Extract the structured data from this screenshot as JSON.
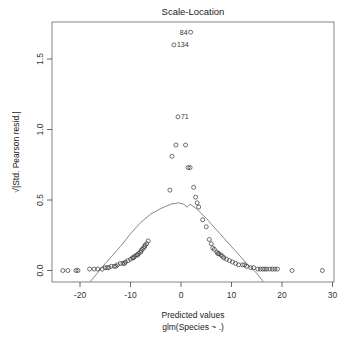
{
  "chart_data": {
    "type": "scatter",
    "title": "Scale-Location",
    "xlabel": "Predicted values",
    "xlabel_sub": "glm(Species ~ .)",
    "ylabel": "√|Std. Pearson resid.|",
    "xlim": [
      -25.5,
      30.3
    ],
    "ylim": [
      -0.08,
      1.76
    ],
    "x_ticks": [
      -20,
      -10,
      0,
      10,
      20,
      30
    ],
    "y_ticks": [
      0.0,
      0.5,
      1.0,
      1.5
    ],
    "y_tick_labels": [
      "0.0",
      "0.5",
      "1.0",
      "1.5"
    ],
    "x_tick_labels": [
      "-20",
      "-10",
      "0",
      "10",
      "20",
      "30"
    ],
    "grid": false,
    "labeled_points": [
      {
        "id": "84",
        "x": 1.9,
        "y": 1.69,
        "label_side": "left"
      },
      {
        "id": "134",
        "x": -1.4,
        "y": 1.6,
        "label_side": "right"
      },
      {
        "id": "71",
        "x": -0.6,
        "y": 1.09,
        "label_side": "right"
      }
    ],
    "points": [
      [
        -23.4,
        0.0
      ],
      [
        -22.4,
        0.0
      ],
      [
        -20.8,
        0.0
      ],
      [
        -20.4,
        0.0
      ],
      [
        -18.1,
        0.01
      ],
      [
        -17.2,
        0.01
      ],
      [
        -16.5,
        0.01
      ],
      [
        -15.6,
        0.01
      ],
      [
        -15.0,
        0.02
      ],
      [
        -14.3,
        0.02
      ],
      [
        -13.8,
        0.03
      ],
      [
        -13.2,
        0.03
      ],
      [
        -12.6,
        0.04
      ],
      [
        -12.0,
        0.05
      ],
      [
        -11.5,
        0.05
      ],
      [
        -11.0,
        0.06
      ],
      [
        -10.5,
        0.07
      ],
      [
        -10.0,
        0.08
      ],
      [
        -9.6,
        0.09
      ],
      [
        -9.2,
        0.1
      ],
      [
        -8.8,
        0.11
      ],
      [
        -8.4,
        0.12
      ],
      [
        -8.0,
        0.13
      ],
      [
        -7.7,
        0.15
      ],
      [
        -7.4,
        0.16
      ],
      [
        -7.1,
        0.18
      ],
      [
        -6.8,
        0.19
      ],
      [
        -6.5,
        0.21
      ],
      [
        -14.6,
        0.02
      ],
      [
        -12.9,
        0.03
      ],
      [
        -11.2,
        0.05
      ],
      [
        -9.4,
        0.09
      ],
      [
        -8.6,
        0.11
      ],
      [
        -7.9,
        0.14
      ],
      [
        -7.2,
        0.17
      ],
      [
        -2.2,
        0.57
      ],
      [
        -1.8,
        0.81
      ],
      [
        -1.0,
        0.89
      ],
      [
        0.9,
        0.89
      ],
      [
        1.4,
        0.73
      ],
      [
        1.8,
        0.73
      ],
      [
        2.5,
        0.59
      ],
      [
        2.9,
        0.52
      ],
      [
        3.2,
        0.48
      ],
      [
        3.5,
        0.45
      ],
      [
        4.3,
        0.36
      ],
      [
        5.0,
        0.31
      ],
      [
        5.6,
        0.22
      ],
      [
        6.0,
        0.19
      ],
      [
        6.6,
        0.15
      ],
      [
        7.1,
        0.13
      ],
      [
        7.5,
        0.12
      ],
      [
        7.9,
        0.11
      ],
      [
        8.5,
        0.09
      ],
      [
        9.0,
        0.08
      ],
      [
        9.6,
        0.07
      ],
      [
        10.2,
        0.06
      ],
      [
        10.8,
        0.05
      ],
      [
        11.4,
        0.04
      ],
      [
        12.2,
        0.04
      ],
      [
        13.0,
        0.03
      ],
      [
        13.8,
        0.02
      ],
      [
        14.4,
        0.02
      ],
      [
        15.2,
        0.01
      ],
      [
        15.7,
        0.01
      ],
      [
        16.2,
        0.01
      ],
      [
        17.0,
        0.01
      ],
      [
        17.6,
        0.01
      ],
      [
        18.1,
        0.01
      ],
      [
        18.6,
        0.01
      ],
      [
        19.1,
        0.01
      ],
      [
        22.0,
        0.0
      ],
      [
        28.0,
        0.0
      ],
      [
        6.3,
        0.16
      ],
      [
        7.3,
        0.12
      ],
      [
        8.2,
        0.1
      ],
      [
        12.6,
        0.04
      ],
      [
        16.6,
        0.01
      ]
    ],
    "smoother": [
      [
        -18.0,
        -0.08
      ],
      [
        -15.0,
        0.05
      ],
      [
        -12.0,
        0.17
      ],
      [
        -10.0,
        0.26
      ],
      [
        -8.0,
        0.34
      ],
      [
        -6.0,
        0.4
      ],
      [
        -4.0,
        0.44
      ],
      [
        -2.0,
        0.47
      ],
      [
        -0.5,
        0.48
      ],
      [
        0.5,
        0.47
      ],
      [
        1.2,
        0.45
      ],
      [
        1.8,
        0.47
      ],
      [
        3.0,
        0.44
      ],
      [
        5.0,
        0.37
      ],
      [
        7.0,
        0.29
      ],
      [
        9.0,
        0.21
      ],
      [
        11.0,
        0.13
      ],
      [
        13.0,
        0.05
      ],
      [
        15.0,
        -0.02
      ],
      [
        16.3,
        -0.08
      ]
    ]
  },
  "colors": {
    "points": "#333333",
    "smoother": "#7a7a7a",
    "axis": "#444444"
  }
}
